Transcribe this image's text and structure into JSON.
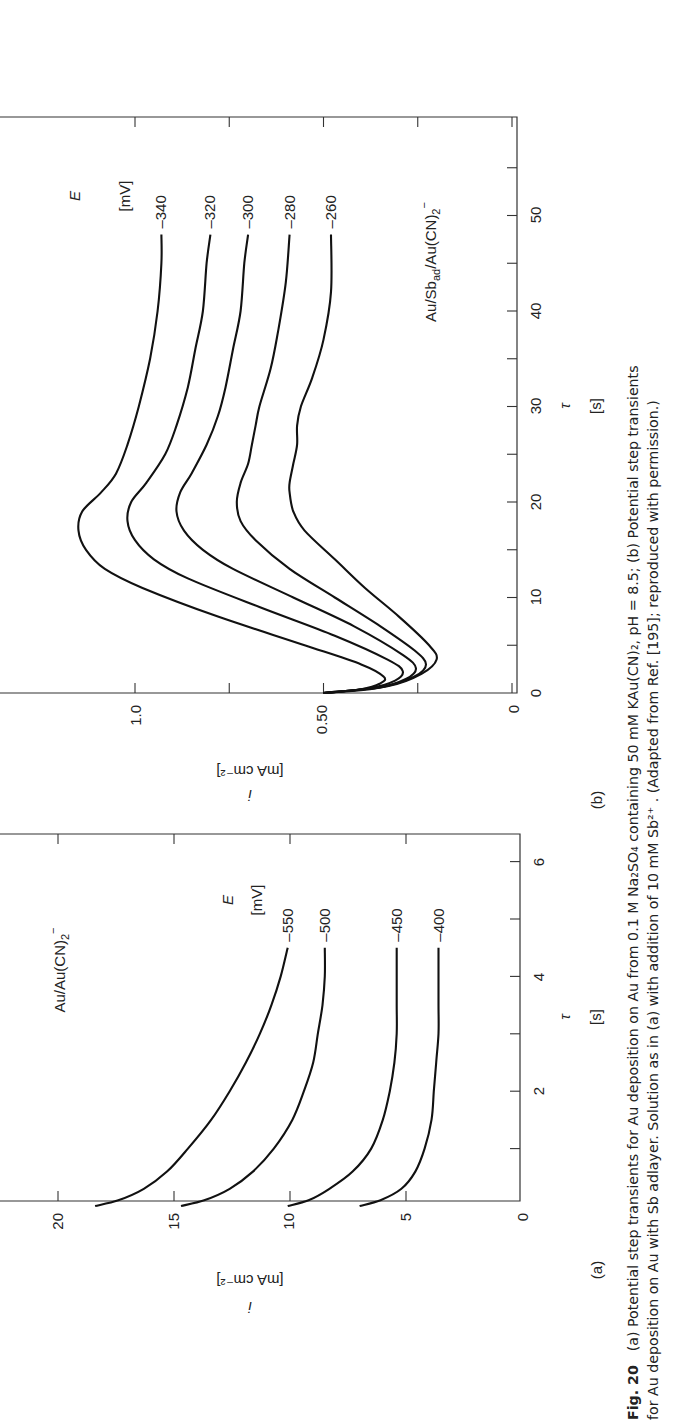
{
  "figure": {
    "number_label": "Fig. 20",
    "caption_line1": "(a) Potential step transients for Au deposition on Au from 0.1 M Na₂SO₄ containing 50 mM KAu(CN)₂, pH = 8.5; (b) Potential step transients",
    "caption_line2": "for Au deposition on Au with Sb adlayer. Solution as in (a) with addition of 10 mM Sb²⁺ . (Adapted from Ref. [195]; reproduced with permission.)",
    "orientation": "rotated 90° counter-clockwise"
  },
  "panels": {
    "a": {
      "label": "(a)",
      "system_label": "Au/Au(CN)₂⁻",
      "legend_title": "E",
      "legend_unit": "[mV]",
      "xlabel": "τ",
      "xunit": "[s]",
      "ylabel": "i",
      "yunit": "[mA cm⁻²]",
      "xticks": [
        "2",
        "4",
        "6"
      ],
      "yticks": [
        "0",
        "5",
        "10",
        "15",
        "20"
      ]
    },
    "b": {
      "label": "(b)",
      "system_label": "Au/Sb_ad/Au(CN)₂⁻",
      "legend_title": "E",
      "legend_unit": "[mV]",
      "xlabel": "τ",
      "xunit": "[s]",
      "ylabel": "i",
      "yunit": "[mA cm⁻²]",
      "xticks": [
        "0",
        "10",
        "20",
        "30",
        "40",
        "50"
      ],
      "yticks": [
        "0",
        "0.50",
        "1.0"
      ]
    }
  },
  "chart_data": [
    {
      "type": "line",
      "panel": "a",
      "title": "Au/Au(CN)2⁻",
      "xlabel": "τ [s]",
      "ylabel": "i [mA cm⁻²]",
      "xlim": [
        0,
        6.1
      ],
      "ylim": [
        0,
        22.5
      ],
      "xticks": [
        0,
        1,
        2,
        3,
        4,
        5,
        6
      ],
      "yticks": [
        0,
        5,
        10,
        15,
        20
      ],
      "legend_title": "E [mV]",
      "series": [
        {
          "name": "-550",
          "x": [
            0.0,
            0.1,
            0.3,
            0.6,
            1.0,
            1.5,
            2.0,
            2.5,
            3.0,
            3.5,
            4.0,
            4.5
          ],
          "y": [
            18.4,
            17.4,
            16.3,
            15.3,
            14.4,
            13.4,
            12.6,
            11.9,
            11.3,
            10.8,
            10.4,
            10.1
          ]
        },
        {
          "name": "-500",
          "x": [
            0.0,
            0.1,
            0.3,
            0.6,
            1.0,
            1.5,
            2.0,
            2.5,
            3.0,
            3.5,
            4.0,
            4.5
          ],
          "y": [
            14.7,
            13.7,
            12.6,
            11.6,
            10.7,
            9.9,
            9.4,
            9.0,
            8.8,
            8.6,
            8.5,
            8.5
          ]
        },
        {
          "name": "-450",
          "x": [
            0.0,
            0.1,
            0.3,
            0.6,
            1.0,
            1.5,
            2.0,
            2.5,
            3.0,
            3.5,
            4.0,
            4.5
          ],
          "y": [
            10.1,
            9.2,
            8.3,
            7.3,
            6.5,
            6.0,
            5.7,
            5.5,
            5.4,
            5.4,
            5.4,
            5.4
          ]
        },
        {
          "name": "-400",
          "x": [
            0.0,
            0.1,
            0.3,
            0.6,
            1.0,
            1.5,
            2.0,
            2.5,
            3.0,
            3.5,
            4.0,
            4.5
          ],
          "y": [
            7.0,
            6.1,
            5.2,
            4.6,
            4.2,
            3.9,
            3.8,
            3.7,
            3.6,
            3.6,
            3.6,
            3.6
          ]
        }
      ]
    },
    {
      "type": "line",
      "panel": "b",
      "title": "Au/Sb_ad/Au(CN)2⁻",
      "xlabel": "τ [s]",
      "ylabel": "i [mA cm⁻²]",
      "xlim": [
        0,
        60.5
      ],
      "ylim": [
        0,
        1.36
      ],
      "xticks": [
        0,
        5,
        10,
        15,
        20,
        25,
        30,
        35,
        40,
        45,
        50,
        55
      ],
      "yticks": [
        0,
        0.25,
        0.5,
        0.75,
        1.0
      ],
      "legend_title": "E [mV]",
      "series": [
        {
          "name": "-340",
          "x": [
            0,
            0.4,
            1.0,
            1.7,
            3,
            5,
            8,
            11,
            13,
            15,
            17,
            19,
            21,
            23,
            26,
            30,
            35,
            40,
            45,
            48
          ],
          "y": [
            0.5,
            0.4,
            0.35,
            0.34,
            0.4,
            0.55,
            0.78,
            0.98,
            1.08,
            1.13,
            1.15,
            1.14,
            1.09,
            1.05,
            1.02,
            0.99,
            0.96,
            0.94,
            0.93,
            0.93
          ]
        },
        {
          "name": "-320",
          "x": [
            0,
            0.5,
            1.3,
            2.3,
            3.5,
            6,
            9,
            12,
            14,
            16,
            18,
            20,
            22,
            25,
            28,
            32,
            36,
            40,
            45,
            48
          ],
          "y": [
            0.5,
            0.38,
            0.31,
            0.29,
            0.33,
            0.47,
            0.67,
            0.86,
            0.95,
            1.0,
            1.02,
            1.01,
            0.97,
            0.92,
            0.89,
            0.86,
            0.84,
            0.82,
            0.81,
            0.8
          ]
        },
        {
          "name": "-300",
          "x": [
            0,
            0.5,
            1.5,
            2.6,
            4,
            7,
            10,
            13,
            15,
            17,
            19,
            21,
            23,
            26,
            29,
            32,
            36,
            40,
            45,
            48
          ],
          "y": [
            0.5,
            0.36,
            0.28,
            0.255,
            0.29,
            0.42,
            0.58,
            0.74,
            0.82,
            0.87,
            0.89,
            0.88,
            0.85,
            0.81,
            0.78,
            0.76,
            0.74,
            0.72,
            0.71,
            0.7
          ]
        },
        {
          "name": "-280",
          "x": [
            0,
            0.6,
            1.7,
            3.0,
            4.5,
            7,
            10,
            13,
            16,
            18,
            20,
            22,
            24,
            26,
            28,
            30,
            34,
            38,
            43,
            48
          ],
          "y": [
            0.5,
            0.35,
            0.26,
            0.228,
            0.26,
            0.35,
            0.47,
            0.59,
            0.68,
            0.72,
            0.73,
            0.72,
            0.7,
            0.69,
            0.68,
            0.67,
            0.64,
            0.62,
            0.6,
            0.59
          ]
        },
        {
          "name": "-260",
          "x": [
            0,
            0.7,
            2.0,
            3.5,
            5,
            8,
            11,
            14,
            17,
            19,
            21,
            22,
            24,
            26,
            28,
            30,
            33,
            37,
            42,
            48
          ],
          "y": [
            0.5,
            0.33,
            0.24,
            0.2,
            0.22,
            0.3,
            0.39,
            0.47,
            0.55,
            0.58,
            0.59,
            0.59,
            0.58,
            0.57,
            0.57,
            0.56,
            0.53,
            0.5,
            0.48,
            0.48
          ]
        }
      ]
    }
  ]
}
